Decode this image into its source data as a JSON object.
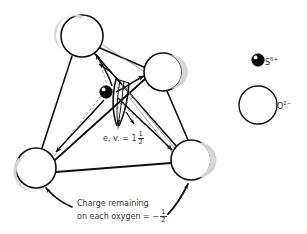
{
  "figure": {
    "type": "chemical-structure-diagram",
    "colors": {
      "outline": "#111111",
      "shading": "#d8d8d8",
      "dashed_bond": "#9a9a9a",
      "text": "#3a3a3a",
      "sulfur_fill": "#0b0b0b",
      "oxygen_fill": "#ffffff",
      "background": "#ffffff"
    },
    "atoms": [
      {
        "id": "oxygen-top",
        "element": "O",
        "cx": 82,
        "cy": 36,
        "r": 21,
        "shade": "upper-left"
      },
      {
        "id": "oxygen-upper-right",
        "element": "O",
        "cx": 163,
        "cy": 72,
        "r": 19,
        "shade": "right"
      },
      {
        "id": "oxygen-lower-left",
        "element": "O",
        "cx": 36,
        "cy": 168,
        "r": 20,
        "shade": "lower-left"
      },
      {
        "id": "oxygen-lower-right",
        "element": "O",
        "cx": 191,
        "cy": 160,
        "r": 20,
        "shade": "right"
      },
      {
        "id": "sulfur-center",
        "element": "S",
        "cx": 106,
        "cy": 92,
        "r": 6,
        "shade": "filled"
      }
    ],
    "labels": {
      "ev": {
        "prefix": "e. v. = ",
        "whole": "1",
        "numerator": "1",
        "denominator": "2",
        "full_text": "e. v. = 1 1/2"
      },
      "charge": {
        "line1": "Charge remaining",
        "line2_prefix": "on each oxygen = −",
        "numerator": "1",
        "denominator": "2",
        "full_text": "Charge remaining on each oxygen = −1/2"
      }
    },
    "legend": [
      {
        "id": "legend-sulfur",
        "symbol": "S",
        "charge": "6+",
        "text": "S",
        "sup": "6+",
        "marker": "filled-small-circle"
      },
      {
        "id": "legend-oxygen",
        "symbol": "O",
        "charge": "2−",
        "text": "O",
        "sup": "2−",
        "marker": "open-large-circle"
      }
    ]
  }
}
